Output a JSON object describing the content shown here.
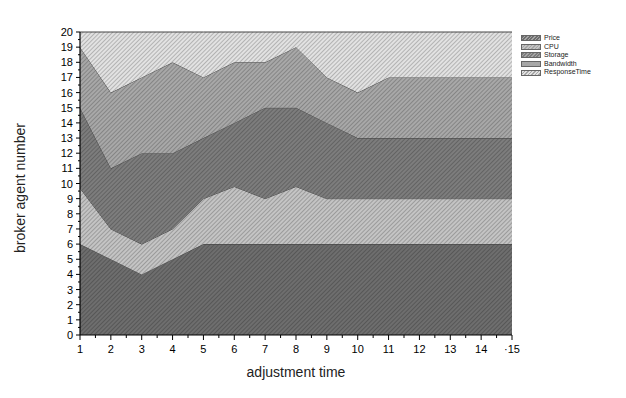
{
  "chart_data": {
    "type": "area",
    "stacked": true,
    "title": "",
    "xlabel": "adjustment time",
    "ylabel": "broker agent number",
    "x": [
      1,
      2,
      3,
      4,
      5,
      6,
      7,
      8,
      9,
      10,
      11,
      12,
      13,
      14,
      15
    ],
    "xlim": [
      1,
      15
    ],
    "ylim": [
      0,
      20
    ],
    "yticks": [
      0,
      1,
      2,
      3,
      4,
      5,
      6,
      7,
      8,
      9,
      10,
      11,
      12,
      13,
      14,
      15,
      16,
      17,
      18,
      19,
      20
    ],
    "xticks": [
      1,
      2,
      3,
      4,
      5,
      6,
      7,
      8,
      9,
      10,
      11,
      12,
      13,
      14,
      15
    ],
    "xtick_labels": [
      "1",
      "2",
      "3",
      "4",
      "5",
      "6",
      "7",
      "8",
      "9",
      "10",
      "11",
      "12",
      "13",
      "14",
      "·15"
    ],
    "grid": false,
    "legend_position": "top-right outside",
    "series": [
      {
        "name": "Price",
        "values": [
          6,
          5,
          4,
          5,
          6,
          6,
          6,
          6,
          6,
          6,
          6,
          6,
          6,
          6,
          6
        ],
        "cumulative_top": [
          6,
          5,
          4,
          5,
          6,
          6,
          6,
          6,
          6,
          6,
          6,
          6,
          6,
          6,
          6
        ],
        "fill": "#6e6e6e"
      },
      {
        "name": "CPU",
        "values": [
          3.7,
          2,
          2,
          2,
          3,
          3.8,
          3,
          3.8,
          3,
          3,
          3,
          3,
          3,
          3,
          3
        ],
        "cumulative_top": [
          9.7,
          7,
          6,
          7,
          9,
          9.8,
          9,
          9.8,
          9,
          9,
          9,
          9,
          9,
          9,
          9
        ],
        "fill": "#c4c4c4"
      },
      {
        "name": "Storage",
        "values": [
          5.3,
          4,
          6,
          5,
          4,
          4.2,
          6,
          5.2,
          5,
          4,
          4,
          4,
          4,
          4,
          4
        ],
        "cumulative_top": [
          15,
          11,
          12,
          12,
          13,
          14,
          15,
          15,
          14,
          13,
          13,
          13,
          13,
          13,
          13
        ],
        "fill": "#7d7d7d"
      },
      {
        "name": "Bandwidth",
        "values": [
          4,
          5,
          5,
          6,
          4,
          4,
          3,
          4,
          3,
          3,
          4,
          4,
          4,
          4,
          4
        ],
        "cumulative_top": [
          19,
          16,
          17,
          18,
          17,
          18,
          18,
          19,
          17,
          16,
          17,
          17,
          17,
          17,
          17
        ],
        "fill": "#a8a8a8"
      },
      {
        "name": "ResponseTime",
        "values": [
          1,
          4,
          3,
          2,
          3,
          2,
          2,
          1,
          3,
          4,
          3,
          3,
          3,
          3,
          3
        ],
        "cumulative_top": [
          20,
          20,
          20,
          20,
          20,
          20,
          20,
          20,
          20,
          20,
          20,
          20,
          20,
          20,
          20
        ],
        "fill": "#e2e2e2"
      }
    ]
  },
  "legend": {
    "items": [
      {
        "label": "Price",
        "color": "#6e6e6e"
      },
      {
        "label": "CPU",
        "color": "#c4c4c4"
      },
      {
        "label": "Storage",
        "color": "#7d7d7d"
      },
      {
        "label": "Bandwidth",
        "color": "#a8a8a8"
      },
      {
        "label": "ResponseTime",
        "color": "#e2e2e2"
      }
    ]
  },
  "axes": {
    "xlabel": "adjustment time",
    "ylabel": "broker agent number"
  }
}
